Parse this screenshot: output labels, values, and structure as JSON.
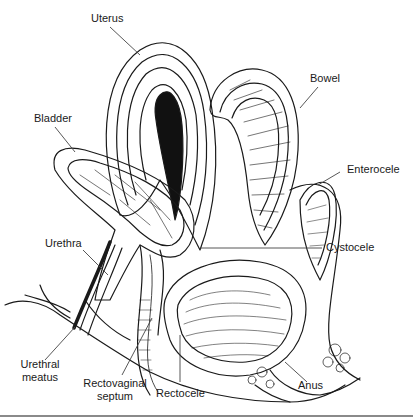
{
  "figure": {
    "labels": {
      "uterus": "Uterus",
      "bowel": "Bowel",
      "bladder": "Bladder",
      "enterocele": "Enterocele",
      "urethra": "Urethra",
      "cystocele": "Cystocele",
      "urethral_meatus_line1": "Urethral",
      "urethral_meatus_line2": "meatus",
      "rectovaginal_septum_line1": "Rectovaginal",
      "rectovaginal_septum_line2": "septum",
      "rectocele": "Rectocele",
      "anus": "Anus"
    },
    "colors": {
      "ink": "#1a1a1a",
      "leader": "#444444",
      "rule": "#8a8a8a",
      "background": "#ffffff"
    }
  }
}
